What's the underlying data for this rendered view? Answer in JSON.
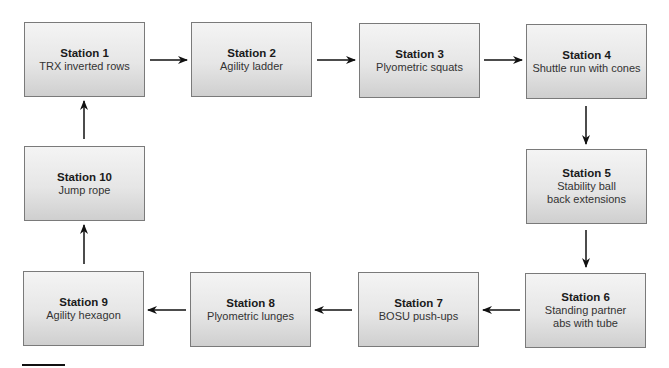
{
  "diagram": {
    "type": "circuit-flow",
    "stations": [
      {
        "id": 1,
        "title": "Station 1",
        "lines": [
          "TRX inverted rows"
        ]
      },
      {
        "id": 2,
        "title": "Station 2",
        "lines": [
          "Agility ladder"
        ]
      },
      {
        "id": 3,
        "title": "Station 3",
        "lines": [
          "Plyometric squats"
        ]
      },
      {
        "id": 4,
        "title": "Station 4",
        "lines": [
          "Shuttle run with cones"
        ]
      },
      {
        "id": 5,
        "title": "Station 5",
        "lines": [
          "Stability ball",
          "back extensions"
        ]
      },
      {
        "id": 6,
        "title": "Station 6",
        "lines": [
          "Standing partner",
          "abs with tube"
        ]
      },
      {
        "id": 7,
        "title": "Station 7",
        "lines": [
          "BOSU push-ups"
        ]
      },
      {
        "id": 8,
        "title": "Station 8",
        "lines": [
          "Plyometric lunges"
        ]
      },
      {
        "id": 9,
        "title": "Station 9",
        "lines": [
          "Agility hexagon"
        ]
      },
      {
        "id": 10,
        "title": "Station 10",
        "lines": [
          "Jump rope"
        ]
      }
    ],
    "flow": [
      [
        1,
        2
      ],
      [
        2,
        3
      ],
      [
        3,
        4
      ],
      [
        4,
        5
      ],
      [
        5,
        6
      ],
      [
        6,
        7
      ],
      [
        7,
        8
      ],
      [
        8,
        9
      ],
      [
        9,
        10
      ],
      [
        10,
        1
      ]
    ],
    "colors": {
      "box_border": "#7a7a7a",
      "box_gradient_top": "#f4f4f4",
      "box_gradient_bottom": "#cfcfcf",
      "arrow": "#111111",
      "text": "#1a1a1a"
    }
  }
}
